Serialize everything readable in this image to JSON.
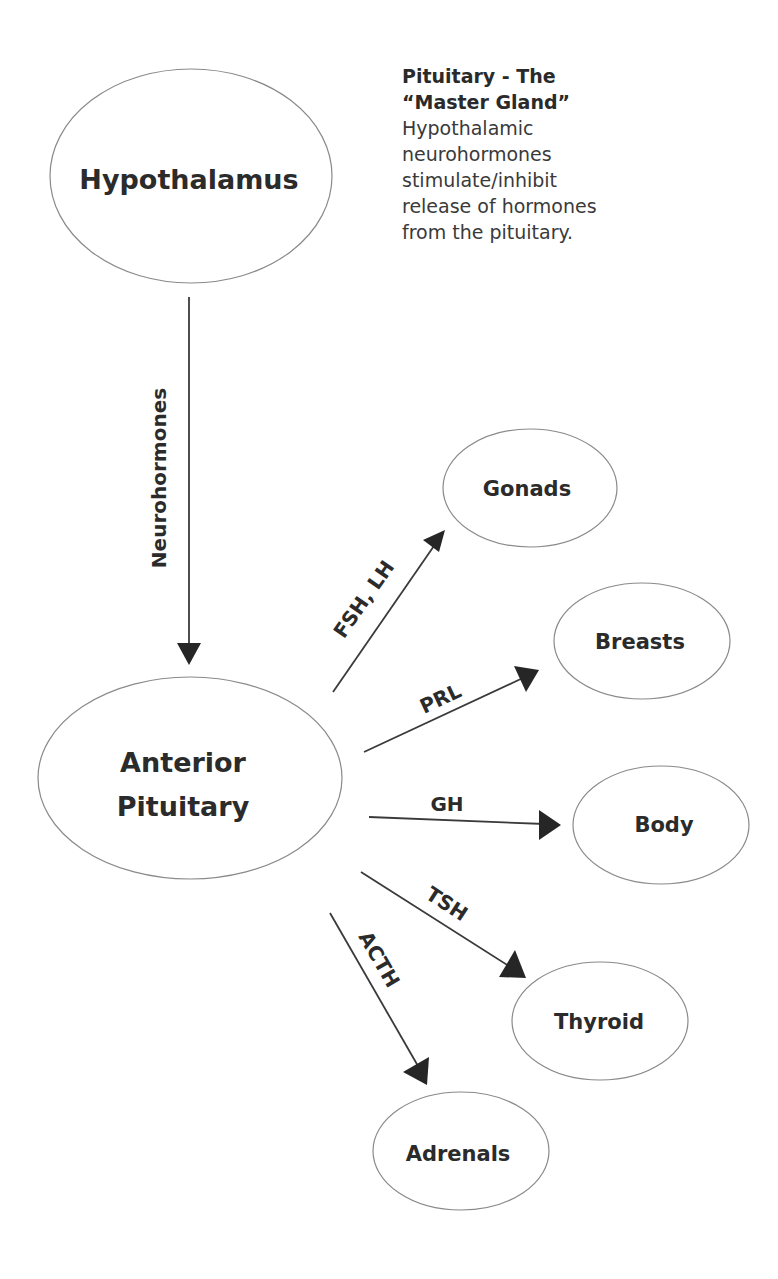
{
  "diagram": {
    "type": "flow",
    "note": {
      "title_lines": [
        "Pituitary - The",
        "“Master Gland”"
      ],
      "body_lines": [
        "Hypothalamic",
        "neurohormones",
        "stimulate/inhibit",
        "release of hormones",
        "from the pituitary."
      ]
    },
    "nodes": {
      "hypothalamus": {
        "label": "Hypothalamus"
      },
      "anterior_pituitary": {
        "label_line1": "Anterior",
        "label_line2": "Pituitary"
      },
      "gonads": {
        "label": "Gonads"
      },
      "breasts": {
        "label": "Breasts"
      },
      "body": {
        "label": "Body"
      },
      "thyroid": {
        "label": "Thyroid"
      },
      "adrenals": {
        "label": "Adrenals"
      }
    },
    "edges": {
      "neurohormones": {
        "from": "Hypothalamus",
        "to": "Anterior Pituitary",
        "label": "Neurohormones"
      },
      "fsh_lh": {
        "from": "Anterior Pituitary",
        "to": "Gonads",
        "label": "FSH, LH"
      },
      "prl": {
        "from": "Anterior Pituitary",
        "to": "Breasts",
        "label": "PRL"
      },
      "gh": {
        "from": "Anterior Pituitary",
        "to": "Body",
        "label": "GH"
      },
      "tsh": {
        "from": "Anterior Pituitary",
        "to": "Thyroid",
        "label": "TSH"
      },
      "acth": {
        "from": "Anterior Pituitary",
        "to": "Adrenals",
        "label": "ACTH"
      }
    },
    "colors": {
      "background": "#ffffff",
      "text": "#2b2b2b",
      "ellipse_stroke": "#8a8a8a",
      "arrow": "#262626"
    }
  }
}
